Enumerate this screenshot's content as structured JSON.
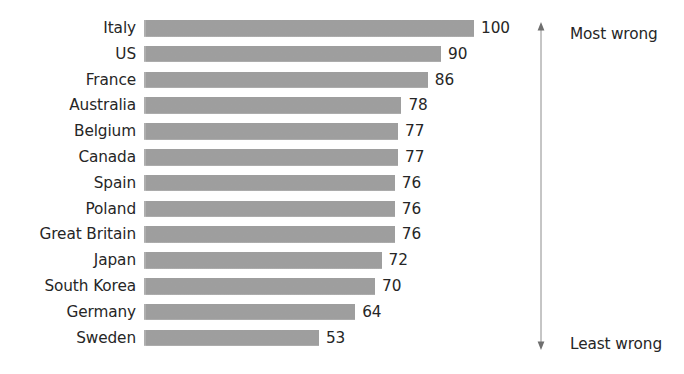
{
  "chart_data": {
    "type": "bar",
    "orientation": "horizontal",
    "title": "",
    "subtitle": "",
    "xlabel": "",
    "ylabel": "",
    "xlim": [
      0,
      100
    ],
    "grid": false,
    "legend": null,
    "categories": [
      "Italy",
      "US",
      "France",
      "Australia",
      "Belgium",
      "Canada",
      "Spain",
      "Poland",
      "Great Britain",
      "Japan",
      "South Korea",
      "Germany",
      "Sweden"
    ],
    "values": [
      100,
      90,
      86,
      78,
      77,
      77,
      76,
      76,
      76,
      72,
      70,
      64,
      53
    ],
    "value_labels": [
      "100",
      "90",
      "86",
      "78",
      "77",
      "77",
      "76",
      "76",
      "76",
      "72",
      "70",
      "64",
      "53"
    ],
    "bar_color": "#a9a9a9",
    "text_color": "#262626",
    "annotations": {
      "top": "Most wrong",
      "bottom": "Least wrong",
      "axis_arrow": "double-headed-vertical-arrow"
    }
  }
}
